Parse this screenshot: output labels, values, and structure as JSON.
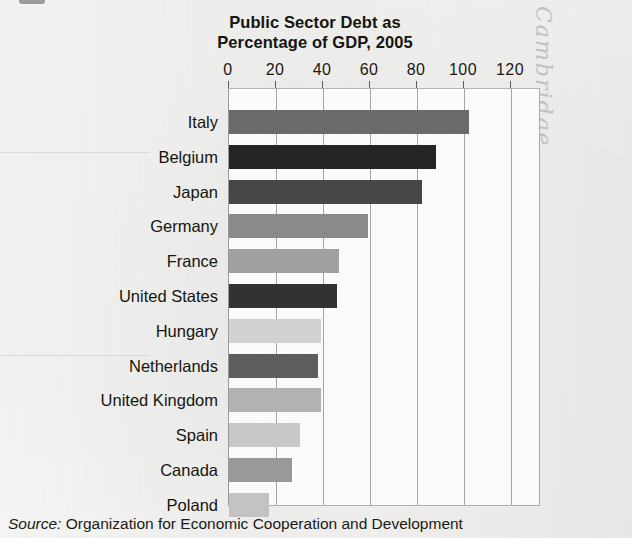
{
  "figure": {
    "title_line1": "Public Sector Debt as",
    "title_line2": "Percentage of GDP, 2005",
    "source_label": "Source:",
    "source_text": "Organization for Economic Cooperation and Development",
    "margin_handwriting": "Cambridge",
    "frame_color": "#a6a6a6",
    "plot_background": "#fcfcfb",
    "page_background": "#f4f4f2"
  },
  "chart_data": {
    "type": "bar",
    "orientation": "horizontal",
    "title": "Public Sector Debt as Percentage of GDP, 2005",
    "xlabel": "",
    "ylabel": "",
    "xlim": [
      0,
      128
    ],
    "xticks": [
      0,
      20,
      40,
      60,
      80,
      100,
      120
    ],
    "xtick_labels": [
      "0",
      "20",
      "40",
      "60",
      "80",
      "100",
      "120"
    ],
    "grid": true,
    "grid_axis": "x",
    "legend": false,
    "categories": [
      "Italy",
      "Belgium",
      "Japan",
      "Germany",
      "France",
      "United States",
      "Hungary",
      "Netherlands",
      "United Kingdom",
      "Spain",
      "Canada",
      "Poland"
    ],
    "values": [
      102,
      88,
      82,
      59,
      47,
      46,
      39,
      38,
      39,
      30,
      27,
      17
    ],
    "bar_colors": [
      "#6b6b6b",
      "#252525",
      "#474747",
      "#8b8b8b",
      "#a2a2a2",
      "#333333",
      "#d3d3d3",
      "#5e5e5e",
      "#b3b3b3",
      "#c9c9c9",
      "#9a9a9a",
      "#c4c4c4"
    ]
  }
}
